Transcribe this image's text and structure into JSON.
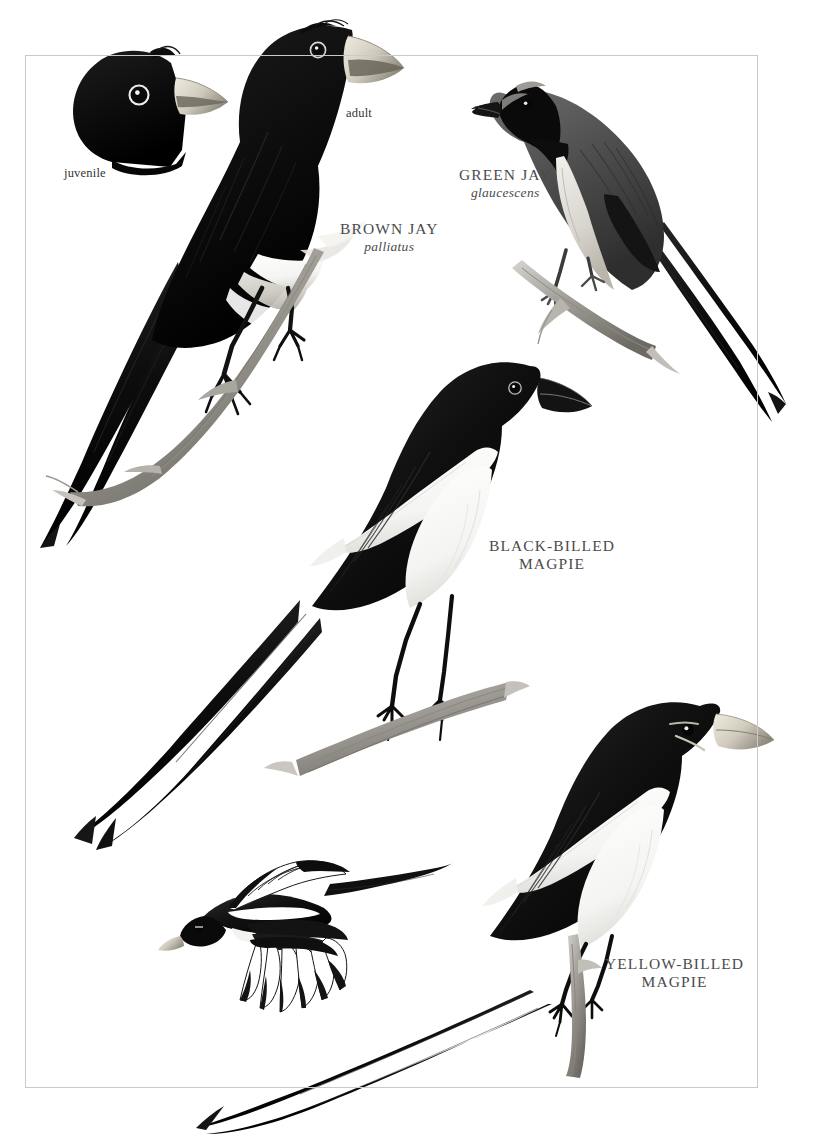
{
  "plate": {
    "background_color": "#ffffff",
    "frame_color": "#c9c9c9",
    "ink_color": "#111111",
    "caption_color": "#4b4b4b"
  },
  "captions": {
    "juvenile": "juvenile",
    "adult": "adult",
    "brown_jay": {
      "common": "BROWN JAY",
      "scientific": "palliatus"
    },
    "green_jay": {
      "common": "GREEN JAY",
      "scientific": "glaucescens"
    },
    "black_billed_magpie": {
      "common": "BLACK-BILLED\nMAGPIE",
      "scientific": ""
    },
    "yellow_billed_magpie": {
      "common": "YELLOW-BILLED\nMAGPIE",
      "scientific": ""
    }
  },
  "figures": [
    {
      "id": "brown-jay-juvenile-head",
      "label": "juvenile",
      "species": "Brown Jay",
      "view": "head only",
      "bill_color": "#d8d4c8",
      "plumage": "blackish head, pale bill, pale eye-ring"
    },
    {
      "id": "brown-jay-adult",
      "label": "adult",
      "species": "Brown Jay",
      "view": "perched, facing right",
      "bill_color": "#cfcabc",
      "plumage": "dark sooty body, whitish belly, white tail tips"
    },
    {
      "id": "green-jay",
      "label": "GREEN JAY",
      "species": "Green Jay",
      "view": "perched, facing left",
      "bill_color": "#1a1a1a",
      "plumage": "black face and throat, gray back, pale underparts, long tail"
    },
    {
      "id": "black-billed-magpie",
      "label": "BLACK-BILLED MAGPIE",
      "species": "Black-billed Magpie",
      "view": "perched on branch, facing right",
      "bill_color": "#1a1a1a",
      "plumage": "black hood and breast, white belly, white scapulars, very long graduated tail"
    },
    {
      "id": "yellow-billed-magpie-flight",
      "label": "",
      "species": "Yellow-billed Magpie",
      "view": "in flight, facing left",
      "bill_color": "#cfc9b6",
      "plumage": "white primary windows, white scapulars and belly, long tail"
    },
    {
      "id": "yellow-billed-magpie",
      "label": "YELLOW-BILLED MAGPIE",
      "species": "Yellow-billed Magpie",
      "view": "perched on branch, facing right",
      "bill_color": "#cfc9b6",
      "plumage": "black hood, pale yellow bill, pale eye crescent, white belly and scapulars, long tail"
    }
  ]
}
